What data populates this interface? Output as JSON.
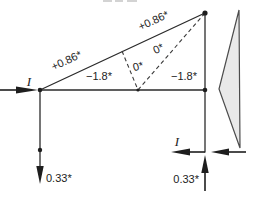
{
  "figure": {
    "type": "truss-force-diagram",
    "colors": {
      "background": "#ffffff",
      "line": "#2b2b2b",
      "text": "#1c1c1c",
      "polygon_fill": "#e9e9e9",
      "polygon_stroke": "#4c4c4c"
    },
    "truss_labels": {
      "top_chord_left": "+0.86*",
      "top_chord_right": "+0.86*",
      "bottom_chord_left": "−1.8*",
      "bottom_chord_right": "−1.8*",
      "diagonal_short": "0*",
      "diagonal_long": "0*"
    },
    "force_labels": {
      "left_load": "I",
      "right_load": "I",
      "left_reaction": "0.33*",
      "right_reaction": "0.33*"
    }
  }
}
